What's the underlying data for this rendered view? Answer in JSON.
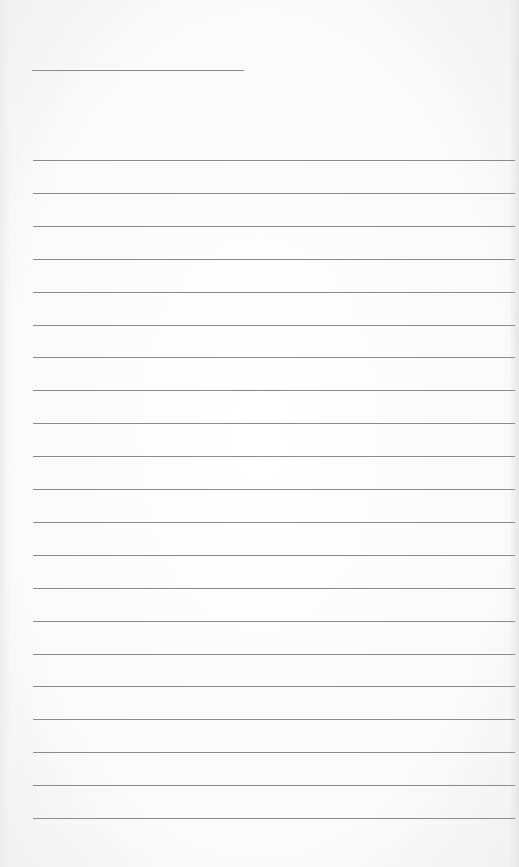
{
  "page": {
    "type": "lined-paper",
    "background_color": "#fbfbfb",
    "line_color": "#8c8c8c"
  },
  "header": {
    "title_line": {
      "x": 32,
      "y": 70,
      "width": 212
    }
  },
  "rules": {
    "count": 21,
    "first_y": 160,
    "spacing": 32.9,
    "left_x": 33
  }
}
